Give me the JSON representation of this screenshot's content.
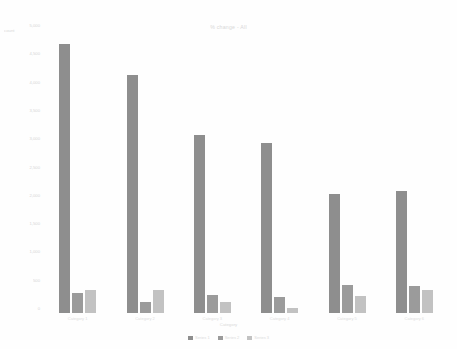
{
  "chart_data": {
    "type": "bar",
    "title": "% change - All",
    "xlabel": "Category",
    "ylabel": "count",
    "grid": false,
    "legend_position": "bottom-center",
    "ylim": [
      0,
      5000
    ],
    "yticks": [
      0,
      500,
      1000,
      1500,
      2000,
      2500,
      3000,
      3500,
      4000,
      4500,
      5000
    ],
    "ytick_labels": [
      "0",
      "500",
      "1,000",
      "1,500",
      "2,000",
      "2,500",
      "3,000",
      "3,500",
      "4,000",
      "4,500",
      "5,000"
    ],
    "categories": [
      "Category 1",
      "Category 2",
      "Category 3",
      "Category 4",
      "Category 5",
      "Category 6"
    ],
    "series": [
      {
        "name": "Series 1",
        "color": "#8e8e8e",
        "values": [
          4750,
          4200,
          3150,
          3000,
          2100,
          2150
        ]
      },
      {
        "name": "Series 2",
        "color": "#9b9b9b",
        "values": [
          350,
          200,
          320,
          280,
          500,
          480
        ]
      },
      {
        "name": "Series 3",
        "color": "#c2c2c2",
        "values": [
          400,
          400,
          200,
          80,
          300,
          400
        ]
      }
    ]
  }
}
